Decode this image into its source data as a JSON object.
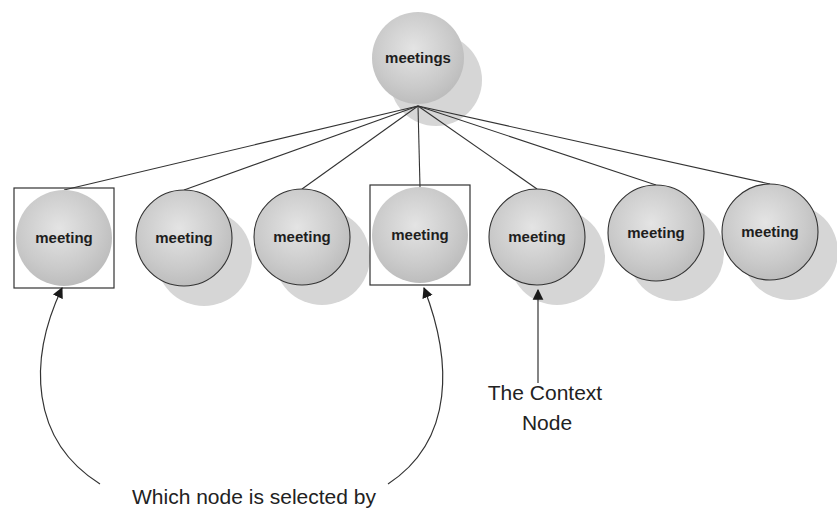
{
  "diagram": {
    "type": "tree",
    "colors": {
      "node_fill": "#c8c8c8",
      "node_fill_light": "#e2e2e2",
      "shadow": "#d6d6d6",
      "stroke": "#333333",
      "background": "#ffffff"
    },
    "root": {
      "id": "root",
      "label": "meetings",
      "cx": 418,
      "cy": 58,
      "r": 46
    },
    "children": [
      {
        "id": "child-1",
        "label": "meeting",
        "cx": 64,
        "cy": 238,
        "r": 48,
        "selected": true,
        "context": false
      },
      {
        "id": "child-2",
        "label": "meeting",
        "cx": 184,
        "cy": 238,
        "r": 48,
        "selected": false,
        "context": false
      },
      {
        "id": "child-3",
        "label": "meeting",
        "cx": 302,
        "cy": 237,
        "r": 48,
        "selected": false,
        "context": false
      },
      {
        "id": "child-4",
        "label": "meeting",
        "cx": 420,
        "cy": 235,
        "r": 48,
        "selected": true,
        "context": false
      },
      {
        "id": "child-5",
        "label": "meeting",
        "cx": 537,
        "cy": 237,
        "r": 48,
        "selected": false,
        "context": true
      },
      {
        "id": "child-6",
        "label": "meeting",
        "cx": 656,
        "cy": 233,
        "r": 48,
        "selected": false,
        "context": false
      },
      {
        "id": "child-7",
        "label": "meeting",
        "cx": 770,
        "cy": 232,
        "r": 48,
        "selected": false,
        "context": false
      }
    ],
    "annotations": {
      "context_node_line1": "The Context",
      "context_node_line2": "Node",
      "selected_caption": "Which node is selected by"
    }
  }
}
